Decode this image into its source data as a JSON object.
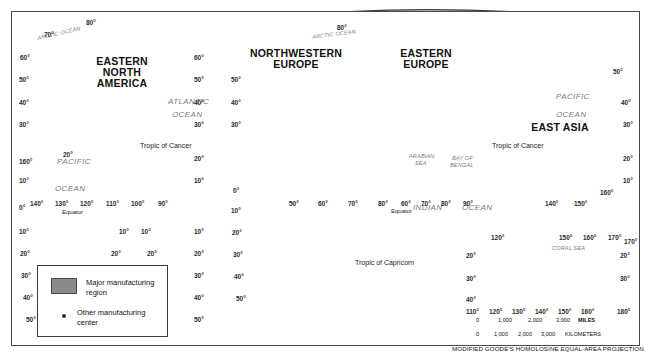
{
  "figure": {
    "projection_note": "MODIFIED GOODE'S HOMOLOSINE EQUAL-AREA PROJECTION",
    "colors": {
      "land": "#c9c9c9",
      "ocean": "#d8d8d8",
      "major_region": "#8a8a8a",
      "dot": "#333333",
      "graticule": "#ffffff",
      "border": "#4a4a4a"
    }
  },
  "legend": {
    "items": [
      {
        "symbol": "filled-rectangle",
        "label": "Major manufacturing region"
      },
      {
        "symbol": "small-dot",
        "label": "Other manufacturing center"
      }
    ]
  },
  "region_labels": [
    {
      "id": "eastern-north-america",
      "lines": [
        "EASTERN",
        "NORTH",
        "AMERICA"
      ],
      "x": 120,
      "y": 64
    },
    {
      "id": "northwestern-europe",
      "lines": [
        "NORTHWESTERN",
        "EUROPE"
      ],
      "x": 294,
      "y": 54
    },
    {
      "id": "eastern-europe",
      "lines": [
        "EASTERN",
        "EUROPE"
      ],
      "x": 425,
      "y": 54
    },
    {
      "id": "east-asia",
      "lines": [
        "EAST ASIA"
      ],
      "x": 555,
      "y": 128
    }
  ],
  "ocean_labels": [
    {
      "id": "arctic-ocean-west",
      "text": "ARCTIC OCEAN",
      "x": 63,
      "y": 35,
      "size": "sm",
      "rotate": -14
    },
    {
      "id": "arctic-ocean-east",
      "text": "ARCTIC OCEAN",
      "x": 333,
      "y": 36,
      "size": "sm",
      "rotate": -8
    },
    {
      "id": "atlantic-ocean",
      "text": "ATLANTIC",
      "x": 172,
      "y": 86,
      "size": "lg",
      "rotate": 0
    },
    {
      "id": "atlantic-ocean-2",
      "text": "OCEAN",
      "x": 174,
      "y": 100,
      "size": "lg",
      "rotate": 0
    },
    {
      "id": "pacific-ocean-west",
      "text": "PACIFIC",
      "x": 62,
      "y": 160,
      "size": "lg",
      "rotate": 0
    },
    {
      "id": "pacific-ocean-west-2",
      "text": "OCEAN",
      "x": 59,
      "y": 187,
      "size": "lg",
      "rotate": 0
    },
    {
      "id": "pacific-ocean-east",
      "text": "PACIFIC",
      "x": 567,
      "y": 96,
      "size": "lg",
      "rotate": 0
    },
    {
      "id": "pacific-ocean-east-2",
      "text": "OCEAN",
      "x": 566,
      "y": 114,
      "size": "lg",
      "rotate": 0
    },
    {
      "id": "indian-ocean",
      "text": "INDIAN",
      "x": 421,
      "y": 207,
      "size": "lg",
      "rotate": 0
    },
    {
      "id": "indian-ocean-2",
      "text": "OCEAN",
      "x": 470,
      "y": 207,
      "size": "lg",
      "rotate": 0
    },
    {
      "id": "arabian-sea",
      "text": "ARABIAN",
      "x": 417,
      "y": 157,
      "size": "sm",
      "rotate": 0
    },
    {
      "id": "arabian-sea-2",
      "text": "SEA",
      "x": 422,
      "y": 164,
      "size": "sm",
      "rotate": 0
    },
    {
      "id": "bay-of-bengal",
      "text": "BAY OF",
      "x": 460,
      "y": 159,
      "size": "sm",
      "rotate": 0
    },
    {
      "id": "bay-of-bengal-2",
      "text": "BENGAL",
      "x": 458,
      "y": 166,
      "size": "sm",
      "rotate": 0
    },
    {
      "id": "coral-sea",
      "text": "CORAL  SEA",
      "x": 570,
      "y": 247,
      "size": "sm",
      "rotate": 0
    }
  ],
  "reference_lines": [
    {
      "id": "tropic-of-cancer-west",
      "text": "Tropic of Cancer",
      "x": 162,
      "y": 146
    },
    {
      "id": "tropic-of-cancer-east",
      "text": "Tropic of Cancer",
      "x": 516,
      "y": 146
    },
    {
      "id": "tropic-of-capricorn",
      "text": "Tropic of Capricorn",
      "x": 385,
      "y": 263
    },
    {
      "id": "equator-west",
      "text": "Equator",
      "x": 77,
      "y": 212
    },
    {
      "id": "equator-east",
      "text": "Equator",
      "x": 400,
      "y": 211
    }
  ],
  "graticule_labels": {
    "west_lobe_left_lat": [
      "80",
      "70",
      "60",
      "50",
      "40",
      "30",
      "20",
      "10",
      "0",
      "10",
      "20",
      "30",
      "40",
      "50"
    ],
    "west_lobe_right_lat": [
      "60",
      "50",
      "40",
      "30",
      "20",
      "10"
    ],
    "west_lobe_lon": [
      "140",
      "130",
      "120",
      "110",
      "100",
      "90"
    ],
    "west_lobe_lower_lon": [
      "10",
      "10",
      "20",
      "20"
    ],
    "hawaii_inset_lon": "160",
    "east_lobe_left_lat": [
      "50",
      "40",
      "30",
      "0",
      "10",
      "20",
      "30",
      "40",
      "50"
    ],
    "east_lobe_right_lat": [
      "50",
      "40",
      "30",
      "20",
      "10"
    ],
    "east_lobe_lon": [
      "50",
      "60",
      "70",
      "80"
    ],
    "east_lobe_lon_lower": [
      "60",
      "70",
      "80",
      "90"
    ],
    "east_lobe_lon_right": [
      "140",
      "150",
      "160",
      "170"
    ],
    "australia_inset_top_lon": [
      "120",
      "150",
      "160",
      "170"
    ],
    "australia_inset_bottom_lon": [
      "110",
      "120",
      "130",
      "140",
      "150",
      "160",
      "180"
    ],
    "australia_inset_lat_left": [
      "20",
      "30",
      "40"
    ],
    "australia_inset_lat_right": [
      "20",
      "30"
    ]
  },
  "scale": {
    "miles": {
      "ticks": [
        "0",
        "1,000",
        "2,000",
        "3,000"
      ],
      "unit": "MILES"
    },
    "kilometers": {
      "ticks": [
        "0",
        "1,000",
        "2,000",
        "3,000"
      ],
      "unit": "KILOMETERS"
    }
  },
  "manufacturing": {
    "major_regions": [
      {
        "name": "Eastern North America",
        "cx": 162,
        "cy": 120
      },
      {
        "name": "Northwestern Europe",
        "cx": 305,
        "cy": 85
      },
      {
        "name": "Eastern Europe",
        "cx": 420,
        "cy": 78
      },
      {
        "name": "East Asia Korea-Japan",
        "cx": 520,
        "cy": 110
      },
      {
        "name": "East Asia China",
        "cx": 510,
        "cy": 133
      }
    ],
    "other_centers_count": 78
  }
}
